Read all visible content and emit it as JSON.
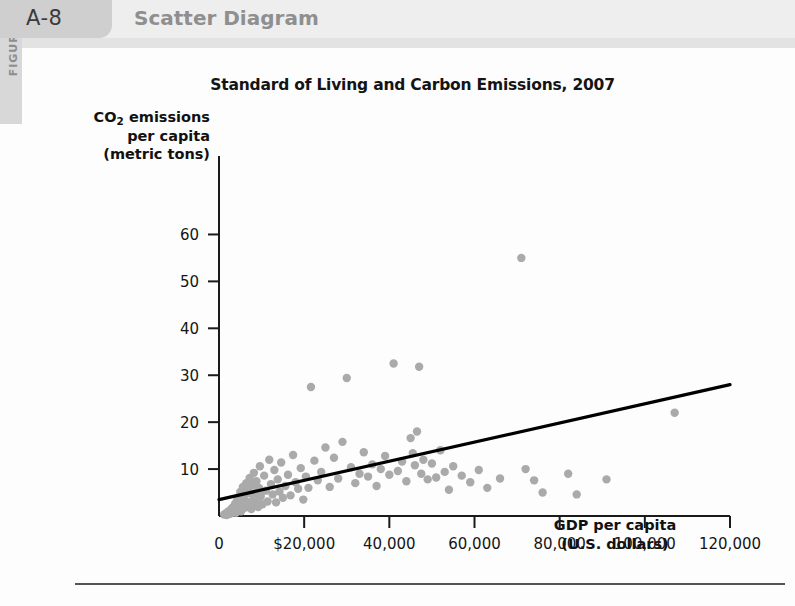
{
  "figure": {
    "rail_label": "FIGURE",
    "number": "A-8",
    "caption": "Scatter Diagram"
  },
  "chart_data": {
    "type": "scatter",
    "title": "Standard of Living and Carbon Emissions, 2007",
    "xlabel_line1": "GDP per capita",
    "xlabel_line2": "(U.S. dollars)",
    "ylabel_line1": "CO",
    "ylabel_sub": "2",
    "ylabel_line1b": " emissions",
    "ylabel_line2": "per capita",
    "ylabel_line3": "(metric tons)",
    "xlim": [
      0,
      120000
    ],
    "ylim": [
      0,
      65
    ],
    "xticks": [
      0,
      20000,
      40000,
      60000,
      80000,
      100000,
      120000
    ],
    "xtick_labels": [
      "0",
      "$20,000",
      "40,000",
      "60,000",
      "80,000",
      "100,000",
      "120,000"
    ],
    "yticks": [
      10,
      20,
      30,
      40,
      50,
      60
    ],
    "ytick_labels": [
      "10",
      "20",
      "30",
      "40",
      "50",
      "60"
    ],
    "grid": false,
    "legend": "none",
    "point_color": "#aaaaaa",
    "point_radius": 4.2,
    "trendline": {
      "label": "linear fit",
      "color": "#000000",
      "x_start": 0,
      "y_start": 3.5,
      "x_end": 120000,
      "y_end": 28.0
    },
    "points": [
      [
        1200,
        0.3
      ],
      [
        1500,
        0.5
      ],
      [
        1800,
        0.2
      ],
      [
        2100,
        0.9
      ],
      [
        2400,
        0.4
      ],
      [
        2600,
        1.2
      ],
      [
        2800,
        0.6
      ],
      [
        3000,
        1.6
      ],
      [
        3200,
        0.8
      ],
      [
        3400,
        2.0
      ],
      [
        3600,
        1.1
      ],
      [
        3800,
        2.6
      ],
      [
        4000,
        0.7
      ],
      [
        4200,
        3.2
      ],
      [
        4400,
        1.4
      ],
      [
        4600,
        4.0
      ],
      [
        4800,
        2.2
      ],
      [
        5000,
        5.1
      ],
      [
        5200,
        1.0
      ],
      [
        5400,
        3.6
      ],
      [
        5600,
        6.2
      ],
      [
        5800,
        2.4
      ],
      [
        6000,
        4.4
      ],
      [
        6200,
        1.8
      ],
      [
        6400,
        7.0
      ],
      [
        6600,
        3.0
      ],
      [
        6800,
        5.6
      ],
      [
        7000,
        2.0
      ],
      [
        7200,
        8.1
      ],
      [
        7400,
        4.8
      ],
      [
        7600,
        1.5
      ],
      [
        7800,
        6.6
      ],
      [
        8000,
        3.4
      ],
      [
        8200,
        9.2
      ],
      [
        8400,
        2.8
      ],
      [
        8600,
        5.0
      ],
      [
        8800,
        7.4
      ],
      [
        9000,
        3.8
      ],
      [
        9200,
        1.9
      ],
      [
        9400,
        6.0
      ],
      [
        9600,
        10.6
      ],
      [
        9800,
        4.2
      ],
      [
        10200,
        2.5
      ],
      [
        10600,
        8.6
      ],
      [
        11000,
        5.4
      ],
      [
        11400,
        3.1
      ],
      [
        11800,
        12.0
      ],
      [
        12200,
        6.8
      ],
      [
        12600,
        4.6
      ],
      [
        13000,
        9.8
      ],
      [
        13400,
        2.9
      ],
      [
        13800,
        7.8
      ],
      [
        14200,
        5.2
      ],
      [
        14600,
        11.4
      ],
      [
        15000,
        3.9
      ],
      [
        15600,
        6.4
      ],
      [
        16200,
        8.8
      ],
      [
        16800,
        4.4
      ],
      [
        17400,
        13.0
      ],
      [
        18000,
        7.2
      ],
      [
        18600,
        5.8
      ],
      [
        19200,
        10.2
      ],
      [
        19800,
        3.5
      ],
      [
        20400,
        8.4
      ],
      [
        21000,
        6.0
      ],
      [
        21600,
        27.5
      ],
      [
        22400,
        11.8
      ],
      [
        23200,
        7.6
      ],
      [
        24000,
        9.4
      ],
      [
        25000,
        14.6
      ],
      [
        26000,
        6.2
      ],
      [
        27000,
        12.4
      ],
      [
        28000,
        8.0
      ],
      [
        29000,
        15.8
      ],
      [
        30000,
        29.4
      ],
      [
        31000,
        10.4
      ],
      [
        32000,
        7.0
      ],
      [
        33000,
        9.0
      ],
      [
        34000,
        13.6
      ],
      [
        35000,
        8.4
      ],
      [
        36000,
        11.0
      ],
      [
        37000,
        6.4
      ],
      [
        38000,
        10.0
      ],
      [
        39000,
        12.8
      ],
      [
        40000,
        8.8
      ],
      [
        41000,
        32.5
      ],
      [
        42000,
        9.6
      ],
      [
        43000,
        11.6
      ],
      [
        44000,
        7.4
      ],
      [
        45000,
        16.6
      ],
      [
        45500,
        13.4
      ],
      [
        46000,
        10.8
      ],
      [
        46500,
        18.0
      ],
      [
        47000,
        31.8
      ],
      [
        47500,
        9.0
      ],
      [
        48000,
        12.0
      ],
      [
        49000,
        7.8
      ],
      [
        50000,
        11.2
      ],
      [
        51000,
        8.2
      ],
      [
        52000,
        14.0
      ],
      [
        53000,
        9.4
      ],
      [
        54000,
        5.6
      ],
      [
        55000,
        10.6
      ],
      [
        57000,
        8.6
      ],
      [
        59000,
        7.2
      ],
      [
        61000,
        9.8
      ],
      [
        63000,
        6.0
      ],
      [
        66000,
        8.0
      ],
      [
        71000,
        55.0
      ],
      [
        72000,
        10.0
      ],
      [
        74000,
        7.6
      ],
      [
        76000,
        5.0
      ],
      [
        82000,
        9.0
      ],
      [
        84000,
        4.6
      ],
      [
        91000,
        7.8
      ],
      [
        107000,
        22.0
      ]
    ]
  },
  "footnote": {
    "rule_present": true
  }
}
